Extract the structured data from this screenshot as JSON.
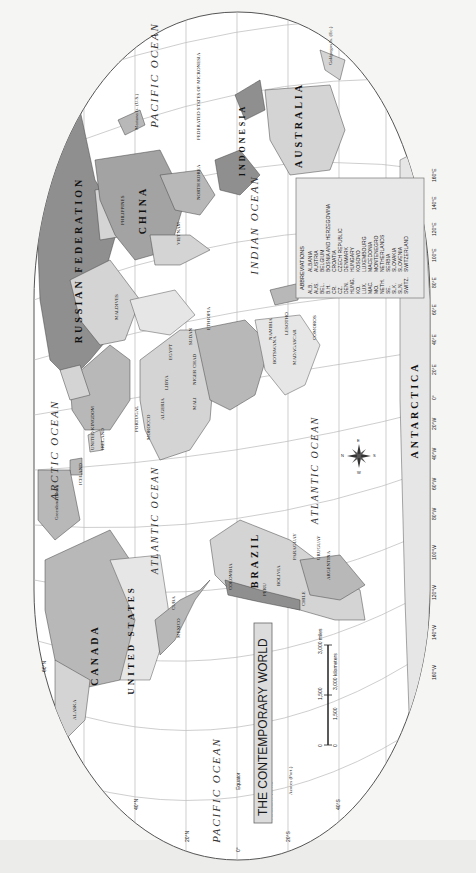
{
  "map": {
    "title": "THE CONTEMPORARY WORLD",
    "orientation": "rotated 90° clockwise (north at left)",
    "colors": {
      "land_dark": "#8f8f8f",
      "land_mid": "#b8b8b8",
      "land_light": "#d4d4d4",
      "land_pale": "#e6e6e6",
      "ocean": "#ffffff",
      "grid": "#b9b9b9",
      "frame": "#555555"
    },
    "oceans": {
      "arctic": "ARCTIC OCEAN",
      "pacific_east": "PACIFIC OCEAN",
      "pacific_west": "PACIFIC OCEAN",
      "atlantic_north": "ATLANTIC OCEAN",
      "atlantic_south": "ATLANTIC OCEAN",
      "indian": "INDIAN OCEAN"
    },
    "large_regions": {
      "russia": "RUSSIAN FEDERATION",
      "china": "CHINA",
      "canada": "CANADA",
      "united_states": "UNITED STATES",
      "brazil": "BRAZIL",
      "australia": "AUSTRALIA",
      "antarctica": "ANTARCTICA",
      "indonesia": "INDONESIA"
    },
    "countries": [
      "ALASKA",
      "MEXICO",
      "CUBA",
      "BAHAMAS",
      "DOMINICAN REPUBLIC",
      "HAITI",
      "JAMAICA",
      "BELIZE",
      "GUATEMALA",
      "EL SALVADOR",
      "HONDURAS",
      "NICARAGUA",
      "COSTA RICA",
      "PANAMA",
      "VENEZUELA",
      "COLOMBIA",
      "ECUADOR",
      "PERU",
      "BOLIVIA",
      "CHILE",
      "PARAGUAY",
      "URUGUAY",
      "ARGENTINA",
      "GUYANA",
      "SURINAME",
      "French Guiana (Fr.)",
      "TRINIDAD AND TOBAGO",
      "GRENADA",
      "BARBADOS",
      "ST. LUCIA",
      "DOMINICA",
      "ANTIGUA AND BARBUDA",
      "ST. KITTS AND NEVIS",
      "Greenland (Den.)",
      "ICELAND",
      "IRELAND",
      "UNITED KINGDOM",
      "NORWAY",
      "SWEDEN",
      "FINLAND",
      "ESTONIA",
      "LATVIA",
      "LITHUANIA",
      "BELARUS",
      "UKRAINE",
      "MOLDOVA",
      "POLAND",
      "GERMANY",
      "FRANCE",
      "SPAIN",
      "PORTUGAL",
      "ITALY",
      "ROMANIA",
      "BULGARIA",
      "GREECE",
      "TURKEY",
      "CYPRUS",
      "MOROCCO",
      "Western Sahara",
      "ALGERIA",
      "TUNISIA",
      "LIBYA",
      "EGYPT",
      "MAURITANIA",
      "MALI",
      "NIGER",
      "CHAD",
      "SUDAN",
      "ERITREA",
      "DJIBOUTI",
      "ETHIOPIA",
      "SOMALIA",
      "KENYA",
      "UGANDA",
      "RWANDA",
      "BURUNDI",
      "TANZANIA",
      "CAPE VERDE",
      "SENEGAL",
      "GAMBIA",
      "GUINEA-BISSAU",
      "GUINEA",
      "SIERRA LEONE",
      "LIBERIA",
      "CÔTE D'IVOIRE",
      "BURKINA FASO",
      "GHANA",
      "TOGO",
      "BENIN",
      "NIGERIA",
      "CAMEROON",
      "EQ. GUINEA",
      "GABON",
      "SÃO TOMÉ & PRÍNCIPE",
      "CONGO",
      "DEM. REP. OF THE CONGO",
      "CENTRAL AFRICAN REP.",
      "ANGOLA",
      "ZAMBIA",
      "MALAWI",
      "MOZAMBIQUE",
      "ZIMBABWE",
      "BOTSWANA",
      "NAMIBIA",
      "SOUTH AFRICA",
      "SWAZILAND",
      "LESOTHO",
      "MADAGASCAR",
      "COMOROS",
      "SEYCHELLES",
      "MAURITIUS",
      "SYRIA",
      "LEBANON",
      "ISRAEL",
      "JORDAN",
      "IRAQ",
      "IRAN",
      "KUWAIT",
      "SAUDI ARABIA",
      "QATAR",
      "UNITED ARAB EMIRATES",
      "OMAN",
      "YEMEN",
      "GEORGIA",
      "ARMENIA",
      "AZERBAIJAN",
      "KAZAKHSTAN",
      "UZBEKISTAN",
      "TURKMENISTAN",
      "KYRGYZSTAN",
      "TAJIKISTAN",
      "AFGHANISTAN",
      "PAKISTAN",
      "INDIA",
      "NEPAL",
      "BHUTAN",
      "BANGLADESH",
      "SRI LANKA",
      "MALDIVES",
      "MONGOLIA",
      "MYANMAR (BURMA)",
      "THAILAND",
      "LAOS",
      "CAMBODIA",
      "VIETNAM",
      "MALAYSIA",
      "SINGAPORE",
      "BRUNEI",
      "PHILIPPINES",
      "TAIWAN",
      "NORTH KOREA",
      "SOUTH KOREA",
      "JAPAN",
      "TIMOR-LESTE",
      "PAPUA NEW GUINEA",
      "PALAU",
      "FEDERATED STATES OF MICRONESIA",
      "Mariana Is. (U.S.)",
      "Guam (U.S.)",
      "MARSHALL IS.",
      "NAURU",
      "KIRIBATI",
      "TUVALU",
      "SOLOMON IS.",
      "VANUATU",
      "FIJI",
      "New Caledonia (Fr.)",
      "NEW ZEALAND",
      "Tasmania (AUST.)",
      "SAMOA",
      "TONGA",
      "Hawaii",
      "Galápagos Is. (Ec.)",
      "Easter I. (Chile)",
      "Falkland Is. (U.K.)",
      "Azores (Port.)",
      "Canary Is. (Sp.)"
    ],
    "latitude_labels": [
      "80°N",
      "60°N",
      "40°N",
      "20°N",
      "0°",
      "20°S",
      "40°S",
      "60°S",
      "Equator"
    ],
    "longitude_labels": [
      "160°W",
      "140°W",
      "120°W",
      "100°W",
      "80°W",
      "60°W",
      "40°W",
      "20°W",
      "0°",
      "20°E",
      "40°E",
      "60°E",
      "80°E",
      "100°E",
      "120°E",
      "140°E",
      "160°E"
    ],
    "scale": {
      "miles_ticks": [
        "0",
        "1,500",
        "3,000 miles"
      ],
      "km_ticks": [
        "0",
        "1,500",
        "3,000 kilometers"
      ]
    },
    "compass": {
      "n": "N",
      "s": "S",
      "e": "E",
      "w": "W"
    },
    "abbreviations": {
      "heading": "ABBREVIATIONS",
      "items": [
        {
          "abbr": "ALB.",
          "name": "ALBANIA"
        },
        {
          "abbr": "AUS.",
          "name": "AUSTRIA"
        },
        {
          "abbr": "BEL.",
          "name": "BELGIUM"
        },
        {
          "abbr": "B.H.",
          "name": "BOSNIA AND HERZEGOVINA"
        },
        {
          "abbr": "CR.",
          "name": "CROATIA"
        },
        {
          "abbr": "CZ.",
          "name": "CZECH REPUBLIC"
        },
        {
          "abbr": "DEN.",
          "name": "DENMARK"
        },
        {
          "abbr": "HUNG.",
          "name": "HUNGARY"
        },
        {
          "abbr": "KO.",
          "name": "KOSOVO"
        },
        {
          "abbr": "LUX.",
          "name": "LUXEMBOURG"
        },
        {
          "abbr": "MAC.",
          "name": "MACEDONIA"
        },
        {
          "abbr": "MO.",
          "name": "MONTENEGRO"
        },
        {
          "abbr": "NETH.",
          "name": "NETHERLANDS"
        },
        {
          "abbr": "SE.",
          "name": "SERBIA"
        },
        {
          "abbr": "SLK.",
          "name": "SLOVAKIA"
        },
        {
          "abbr": "SLN.",
          "name": "SLOVENIA"
        },
        {
          "abbr": "SWITZ.",
          "name": "SWITZERLAND"
        }
      ]
    }
  }
}
